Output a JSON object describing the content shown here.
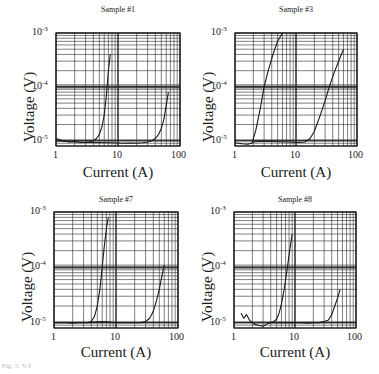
{
  "figure": {
    "caption_fragment": "Fig. 5. V-I"
  },
  "chart_data": [
    {
      "type": "line",
      "title": "Sample #1",
      "xlabel": "Current (A)",
      "ylabel": "Voltage (V)",
      "xscale": "log",
      "yscale": "log",
      "xlim": [
        1,
        100
      ],
      "ylim": [
        8e-06,
        0.001
      ],
      "xticks": [
        "1",
        "10",
        "100"
      ],
      "yticks": [
        "10^-5",
        "10^-4",
        "10^-3"
      ],
      "grid": true,
      "legend": null,
      "series": [
        {
          "name": "curve-1",
          "x": [
            1,
            1.3,
            1.6,
            2,
            2.5,
            3,
            3.5,
            4,
            4.5,
            5,
            5.5,
            6,
            6.5,
            7,
            7.5
          ],
          "y": [
            1.1e-05,
            1e-05,
            9.5e-06,
            9.8e-06,
            9.3e-06,
            9.4e-06,
            9.6e-06,
            1e-05,
            1.1e-05,
            1.3e-05,
            1.8e-05,
            3e-05,
            7e-05,
            0.0002,
            0.0004
          ]
        },
        {
          "name": "curve-2",
          "x": [
            1,
            2,
            4,
            8,
            12,
            16,
            20,
            25,
            30,
            35,
            40,
            45,
            50,
            55,
            60,
            65
          ],
          "y": [
            1e-05,
            9.5e-06,
            9.3e-06,
            9.2e-06,
            9e-06,
            9.1e-06,
            9e-06,
            9.2e-06,
            9.5e-06,
            1e-05,
            1.1e-05,
            1.3e-05,
            1.7e-05,
            2.5e-05,
            4.5e-05,
            8e-05
          ]
        }
      ]
    },
    {
      "type": "line",
      "title": "Sample #3",
      "xlabel": "Current (A)",
      "ylabel": "Voltage (V)",
      "xscale": "log",
      "yscale": "log",
      "xlim": [
        1,
        100
      ],
      "ylim": [
        8e-06,
        0.001
      ],
      "xticks": [
        "1",
        "10",
        "100"
      ],
      "yticks": [
        "10^-5",
        "10^-4",
        "10^-3"
      ],
      "grid": true,
      "legend": null,
      "series": [
        {
          "name": "curve-1",
          "x": [
            1,
            1.3,
            1.6,
            1.9,
            2.2,
            2.6,
            3.0,
            3.5,
            4.2,
            5.0,
            6.0
          ],
          "y": [
            9.2e-06,
            8.8e-06,
            8.6e-06,
            9e-06,
            1.6e-05,
            4e-05,
            0.0001,
            0.0002,
            0.0004,
            0.0007,
            0.001
          ]
        },
        {
          "name": "curve-2",
          "x": [
            1.9,
            3,
            5,
            8,
            11,
            14,
            17,
            20,
            25,
            30,
            35,
            42,
            50,
            60
          ],
          "y": [
            9.5e-06,
            9.8e-06,
            9.6e-06,
            9.5e-06,
            9.3e-06,
            9.5e-06,
            1.1e-05,
            1.5e-05,
            3e-05,
            5.5e-05,
            0.0001,
            0.00018,
            0.0003,
            0.0005
          ]
        }
      ]
    },
    {
      "type": "line",
      "title": "Sample #7",
      "xlabel": "Current (A)",
      "ylabel": "Voltage (V)",
      "xscale": "log",
      "yscale": "log",
      "xlim": [
        1,
        100
      ],
      "ylim": [
        8e-06,
        0.001
      ],
      "xticks": [
        "1",
        "10",
        "100"
      ],
      "yticks": [
        "10^-5",
        "10^-4",
        "10^-3"
      ],
      "grid": true,
      "legend": null,
      "series": [
        {
          "name": "curve-1",
          "x": [
            1,
            1.5,
            2,
            2.5,
            3,
            3.5,
            4,
            4.5,
            5,
            5.5,
            6,
            6.5,
            7,
            7.5
          ],
          "y": [
            1e-05,
            1e-05,
            9.8e-06,
            1e-05,
            1e-05,
            1e-05,
            1.05e-05,
            1.3e-05,
            2e-05,
            4e-05,
            0.0001,
            0.00025,
            0.0005,
            0.0008
          ]
        },
        {
          "name": "curve-2",
          "x": [
            3.5,
            6,
            10,
            15,
            20,
            25,
            30,
            35,
            40,
            45,
            50,
            55,
            60
          ],
          "y": [
            1e-05,
            1.05e-05,
            1e-05,
            1e-05,
            1e-05,
            1e-05,
            1.05e-05,
            1.2e-05,
            1.6e-05,
            2.5e-05,
            4e-05,
            7e-05,
            0.00011
          ]
        }
      ]
    },
    {
      "type": "line",
      "title": "Sample #8",
      "xlabel": "Current (A)",
      "ylabel": "Voltage (V)",
      "xscale": "log",
      "yscale": "log",
      "xlim": [
        1,
        100
      ],
      "ylim": [
        8e-06,
        0.001
      ],
      "xticks": [
        "1",
        "10",
        "100"
      ],
      "yticks": [
        "10^-5",
        "10^-4",
        "10^-3"
      ],
      "grid": true,
      "legend": null,
      "series": [
        {
          "name": "curve-1",
          "x": [
            1.3,
            1.45,
            1.6,
            1.8,
            2.1,
            2.5,
            3,
            3.5,
            4,
            4.5,
            5,
            5.5,
            6,
            6.5,
            7,
            7.5,
            8,
            8.5,
            9
          ],
          "y": [
            1.5e-05,
            1.2e-05,
            1.4e-05,
            1.1e-05,
            9.5e-06,
            9e-06,
            8.6e-06,
            9.5e-06,
            1e-05,
            1.05e-05,
            1.15e-05,
            1.5e-05,
            2.2e-05,
            3.5e-05,
            6e-05,
            0.0001,
            0.00017,
            0.00027,
            0.0004
          ]
        },
        {
          "name": "curve-2",
          "x": [
            3.5,
            5,
            8,
            12,
            16,
            20,
            25,
            30,
            35,
            40,
            45,
            50,
            55
          ],
          "y": [
            1e-05,
            1e-05,
            1e-05,
            1e-05,
            9.8e-06,
            1e-05,
            1e-05,
            1.05e-05,
            1.1e-05,
            1.4e-05,
            2e-05,
            2.8e-05,
            4e-05
          ]
        }
      ]
    }
  ],
  "panels": [
    {
      "title": "Sample #1",
      "frame": {
        "left": 56,
        "top": 33,
        "right": 180,
        "bottom": 146
      },
      "title_pos": {
        "x": 118,
        "y": 5
      },
      "ylabel_pos": {
        "x": 21,
        "y": 142
      },
      "xlabel_pos": {
        "x": 118,
        "y": 164
      }
    },
    {
      "title": "Sample #3",
      "frame": {
        "left": 235,
        "top": 33,
        "right": 357,
        "bottom": 146
      },
      "title_pos": {
        "x": 296,
        "y": 5
      },
      "ylabel_pos": {
        "x": 200,
        "y": 142
      },
      "xlabel_pos": {
        "x": 296,
        "y": 164
      }
    },
    {
      "title": "Sample #7",
      "frame": {
        "left": 54,
        "top": 212,
        "right": 178,
        "bottom": 328
      },
      "title_pos": {
        "x": 116,
        "y": 195
      },
      "ylabel_pos": {
        "x": 19,
        "y": 322
      },
      "xlabel_pos": {
        "x": 116,
        "y": 344
      }
    },
    {
      "title": "Sample #8",
      "frame": {
        "left": 234,
        "top": 212,
        "right": 356,
        "bottom": 328
      },
      "title_pos": {
        "x": 295,
        "y": 195
      },
      "ylabel_pos": {
        "x": 199,
        "y": 322
      },
      "xlabel_pos": {
        "x": 295,
        "y": 344
      }
    }
  ],
  "labels": {
    "xlabel": "Current (A)",
    "ylabel": "Voltage (V)",
    "xtick_1": "1",
    "xtick_10": "10",
    "xtick_100": "100",
    "ytick_base": "10",
    "ytick_exp_low": "-5",
    "ytick_exp_mid": "-4",
    "ytick_exp_high": "-3"
  },
  "colors": {
    "line": "#1a1a1a",
    "grid": "#2a2a2a",
    "background": "#ffffff"
  }
}
